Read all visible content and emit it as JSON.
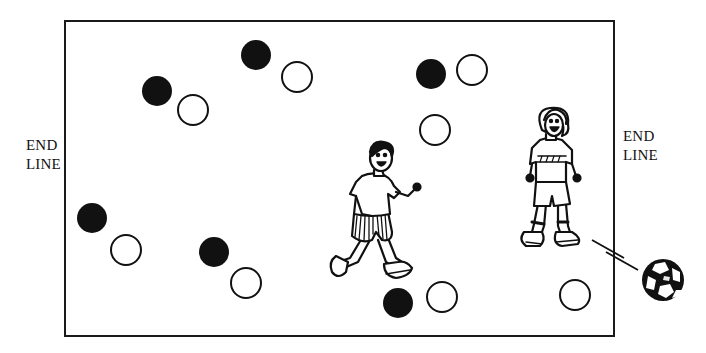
{
  "labels": {
    "left_end_line": [
      "END",
      "LINE"
    ],
    "right_end_line": [
      "END",
      "LINE"
    ]
  },
  "colors": {
    "ink": "#111111",
    "background": "#ffffff"
  },
  "field": {
    "left": 64,
    "top": 20,
    "right": 615,
    "bottom": 337
  },
  "markers": {
    "filled": [
      {
        "x": 157,
        "y": 91
      },
      {
        "x": 256,
        "y": 55
      },
      {
        "x": 431,
        "y": 74
      },
      {
        "x": 92,
        "y": 218
      },
      {
        "x": 214,
        "y": 252
      },
      {
        "x": 398,
        "y": 303
      }
    ],
    "hollow": [
      {
        "x": 193,
        "y": 110
      },
      {
        "x": 297,
        "y": 77
      },
      {
        "x": 472,
        "y": 70
      },
      {
        "x": 435,
        "y": 130
      },
      {
        "x": 126,
        "y": 250
      },
      {
        "x": 246,
        "y": 283
      },
      {
        "x": 442,
        "y": 297
      },
      {
        "x": 575,
        "y": 295
      }
    ],
    "radius": 15
  },
  "players": [
    {
      "name": "boy-runner",
      "description": "running boy with striped shorts"
    },
    {
      "name": "girl-standing",
      "description": "girl standing near the right end line"
    }
  ],
  "ball": {
    "x": 663,
    "y": 280,
    "r": 21
  }
}
